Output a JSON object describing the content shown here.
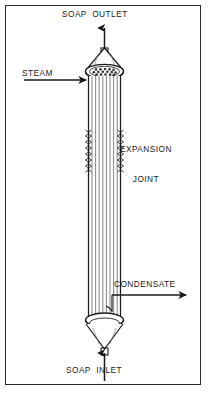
{
  "diagram": {
    "equipment_name": "soap-heat-exchanger",
    "labels": {
      "soap_outlet": "SOAP  OUTLET",
      "steam": "STEAM",
      "expansion_joint_line1": "EXPANSION",
      "expansion_joint_line2": "JOINT",
      "condensate": "CONDENSATE",
      "soap_inlet": "SOAP  INLET"
    },
    "flows": [
      {
        "name": "soap-outlet",
        "label": "SOAP  OUTLET",
        "direction": "up",
        "position": "top"
      },
      {
        "name": "steam-inlet",
        "label": "STEAM",
        "direction": "right",
        "position": "upper-left"
      },
      {
        "name": "condensate-outlet",
        "label": "CONDENSATE",
        "direction": "right",
        "position": "lower-right"
      },
      {
        "name": "soap-inlet",
        "label": "SOAP  INLET",
        "direction": "up",
        "position": "bottom"
      }
    ],
    "components": [
      {
        "name": "top-cone-head",
        "type": "conical-head"
      },
      {
        "name": "top-tube-sheet",
        "type": "tube-sheet"
      },
      {
        "name": "tube-bundle",
        "type": "vertical-tubes",
        "tube_count": 9
      },
      {
        "name": "expansion-joint",
        "type": "bellows"
      },
      {
        "name": "bottom-tube-sheet",
        "type": "tube-sheet"
      },
      {
        "name": "bottom-cone-head",
        "type": "conical-head"
      }
    ],
    "colors": {
      "line": "#1a1a1a",
      "border": "#2b2b2b",
      "background": "#ffffff",
      "tube_fill": "#9a9a9a"
    }
  }
}
